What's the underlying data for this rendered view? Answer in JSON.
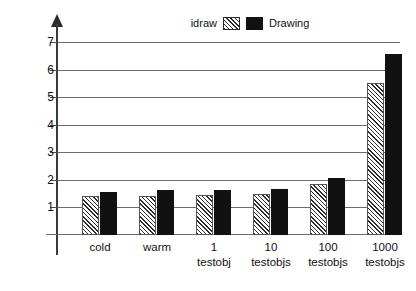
{
  "chart_data": {
    "type": "bar",
    "title": "",
    "xlabel": "",
    "ylabel": "Process Size (MB)",
    "ylim": [
      0,
      7
    ],
    "yticks": [
      1,
      2,
      3,
      4,
      5,
      6,
      7
    ],
    "ytick_labels": [
      "1",
      "2",
      "3",
      "4",
      "5",
      "6",
      "7"
    ],
    "grid": true,
    "legend_position": "top-center",
    "categories": [
      "cold",
      "warm",
      "1 testobj",
      "10 testobjs",
      "100 testobjs",
      "1000 testobjs"
    ],
    "category_lines": [
      {
        "line1": "cold",
        "line2": ""
      },
      {
        "line1": "warm",
        "line2": ""
      },
      {
        "line1": "1",
        "line2": "testobj"
      },
      {
        "line1": "10",
        "line2": "testobjs"
      },
      {
        "line1": "100",
        "line2": "testobjs"
      },
      {
        "line1": "1000",
        "line2": "testobjs"
      }
    ],
    "series": [
      {
        "name": "idraw",
        "fill": "hatched-diagonal",
        "color": "#2d2d2d",
        "values": [
          1.4,
          1.42,
          1.45,
          1.5,
          1.85,
          5.5
        ]
      },
      {
        "name": "Drawing",
        "fill": "solid-black",
        "color": "#111111",
        "values": [
          1.57,
          1.63,
          1.64,
          1.68,
          2.08,
          6.55
        ]
      }
    ]
  },
  "legend": {
    "left_label": "idraw",
    "right_label": "Drawing"
  },
  "axis": {
    "y_title": "Process Size (MB)"
  }
}
